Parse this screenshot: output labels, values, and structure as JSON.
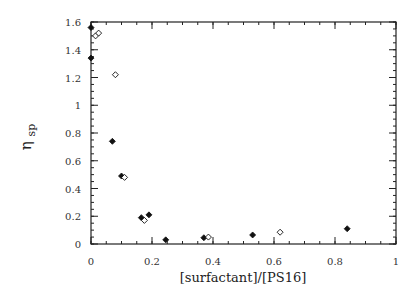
{
  "chart_data": {
    "type": "scatter",
    "title": "",
    "xlabel": "[surfactant]/[PS16]",
    "ylabel_main": "η",
    "ylabel_sub": "sp",
    "xlim": [
      0,
      1
    ],
    "ylim": [
      0,
      1.6
    ],
    "x_ticks": [
      0,
      0.2,
      0.4,
      0.6,
      0.8,
      1
    ],
    "x_tick_labels": [
      "0",
      "0.2",
      "0.4",
      "0.6",
      "0.8",
      "1"
    ],
    "y_ticks": [
      0,
      0.2,
      0.4,
      0.6,
      0.8,
      1,
      1.2,
      1.4,
      1.6
    ],
    "y_tick_labels": [
      "0",
      "0.2",
      "0.4",
      "0.6",
      "0.8",
      "1",
      "1.2",
      "1.4",
      "1.6"
    ],
    "minor_tick_step": 0.05,
    "grid": false,
    "legend": null,
    "series": [
      {
        "name": "filled diamonds",
        "marker": "filled-diamond",
        "color": "#111111",
        "points": [
          {
            "x": 0.0,
            "y": 1.56
          },
          {
            "x": 0.0,
            "y": 1.34
          },
          {
            "x": 0.07,
            "y": 0.74
          },
          {
            "x": 0.1,
            "y": 0.49
          },
          {
            "x": 0.165,
            "y": 0.19
          },
          {
            "x": 0.19,
            "y": 0.21
          },
          {
            "x": 0.245,
            "y": 0.03
          },
          {
            "x": 0.37,
            "y": 0.045
          },
          {
            "x": 0.53,
            "y": 0.065
          },
          {
            "x": 0.84,
            "y": 0.11
          }
        ]
      },
      {
        "name": "open diamonds",
        "marker": "open-diamond",
        "color": "#111111",
        "points": [
          {
            "x": 0.015,
            "y": 1.5
          },
          {
            "x": 0.025,
            "y": 1.52
          },
          {
            "x": 0.08,
            "y": 1.22
          },
          {
            "x": 0.11,
            "y": 0.48
          },
          {
            "x": 0.175,
            "y": 0.17
          },
          {
            "x": 0.385,
            "y": 0.05
          },
          {
            "x": 0.62,
            "y": 0.085
          }
        ]
      }
    ]
  }
}
